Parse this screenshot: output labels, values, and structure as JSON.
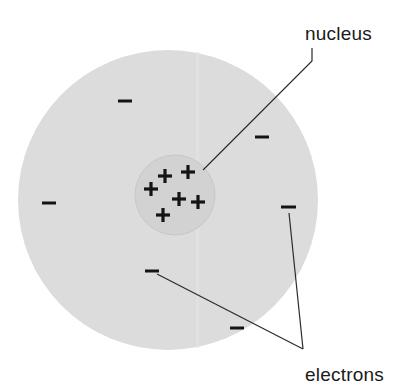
{
  "diagram": {
    "background_color": "#ffffff",
    "electron_cloud": {
      "name": "electron-cloud",
      "fill_color": "#dcdcdc",
      "center_x": 168,
      "center_y": 200,
      "radius": 150
    },
    "nucleus_region": {
      "name": "nucleus-region",
      "fill_color": "#d2d2d2",
      "stroke_color": "#c6c6c6",
      "center_x": 175,
      "center_y": 195,
      "radius": 40
    },
    "charge_color": "#141414",
    "protons": {
      "symbol": "+",
      "count": 6,
      "label": "proton",
      "positions": [
        {
          "x": 165,
          "y": 176
        },
        {
          "x": 188,
          "y": 172
        },
        {
          "x": 151,
          "y": 189
        },
        {
          "x": 179,
          "y": 199
        },
        {
          "x": 198,
          "y": 202
        },
        {
          "x": 163,
          "y": 215
        }
      ]
    },
    "electrons": {
      "symbol": "−",
      "count": 6,
      "label": "electron",
      "positions": [
        {
          "x": 125,
          "y": 101
        },
        {
          "x": 262,
          "y": 137
        },
        {
          "x": 49,
          "y": 203
        },
        {
          "x": 288,
          "y": 207
        },
        {
          "x": 152,
          "y": 271
        },
        {
          "x": 237,
          "y": 328
        }
      ]
    },
    "callouts": [
      {
        "id": "nucleus",
        "text": "nucleus",
        "text_x": 305,
        "text_y": 40,
        "text_anchor": "start",
        "leader_points": "203,170 312,61 312,48"
      },
      {
        "id": "electrons",
        "text": "electrons",
        "text_x": 305,
        "text_y": 381,
        "text_anchor": "start",
        "leader_points_a": "289,213 303,349",
        "leader_points_b": "157,274 303,349",
        "junction_x": 303,
        "junction_y": 349
      }
    ]
  }
}
